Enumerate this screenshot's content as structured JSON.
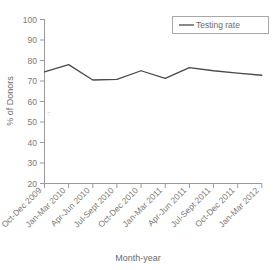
{
  "chart_data": {
    "type": "line",
    "title": "",
    "xlabel": "Month-year",
    "ylabel": "% of Donors",
    "categories": [
      "Oct-Dec 2009",
      "Jan-Mar 2010",
      "Apr-Jun 2010",
      "Jul-Sept 2010",
      "Oct-Dec 2010",
      "Jan-Mar 2011",
      "Apr-Jun 2011",
      "Jul-Sept 2011",
      "Oct-Dec 2011",
      "Jan-Mar 2012"
    ],
    "series": [
      {
        "name": "Testing rate",
        "values": [
          74.5,
          78.0,
          70.5,
          70.8,
          75.0,
          71.3,
          76.5,
          75.0,
          73.8,
          72.8
        ],
        "color": "#4a4a4a"
      }
    ],
    "ylim": [
      20,
      100
    ],
    "yticks": [
      20,
      30,
      40,
      50,
      60,
      70,
      80,
      90,
      100
    ],
    "ytick_labels": [
      "20",
      "30",
      "40",
      "50",
      "60",
      "70",
      "80",
      "90",
      "100"
    ],
    "grid": false,
    "legend_position": "top-right",
    "legend_entries": [
      "Testing rate"
    ],
    "xtick_rotation": 45
  },
  "axes": {
    "y_title": "% of Donors",
    "x_title": "Month-year"
  },
  "legend": {
    "items": [
      {
        "label": "Testing rate",
        "marker": "line-marker",
        "color": "#4a4a4a"
      }
    ]
  }
}
